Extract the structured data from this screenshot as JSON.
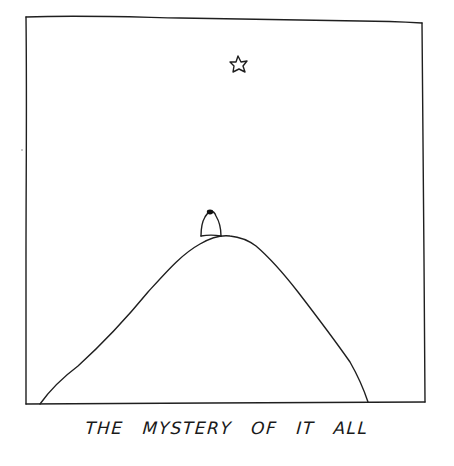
{
  "caption": {
    "words": [
      "THE",
      "MYSTERY",
      "OF",
      "IT",
      "ALL"
    ],
    "full_text": "THE MYSTERY OF IT ALL"
  },
  "illustration": {
    "elements": [
      "frame",
      "mountain",
      "figure",
      "star"
    ],
    "stroke_color": "#1a1a1a",
    "background_color": "#ffffff"
  }
}
